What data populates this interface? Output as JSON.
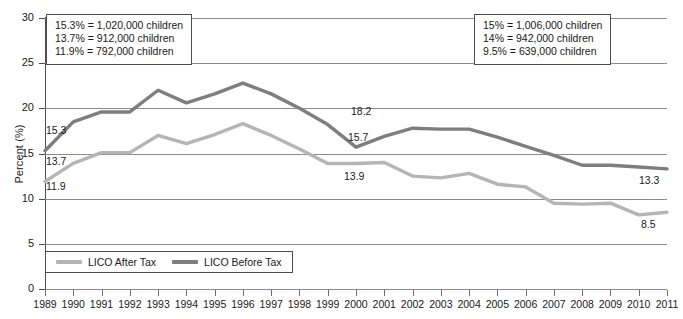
{
  "chart_data": {
    "type": "line",
    "title": "",
    "xlabel": "",
    "ylabel": "Percent (%)",
    "ylim": [
      0,
      30
    ],
    "ytick_step": 5,
    "grid": true,
    "legend_position": "bottom-left",
    "x": [
      1989,
      1990,
      1991,
      1992,
      1993,
      1994,
      1995,
      1996,
      1997,
      1998,
      1999,
      2000,
      2001,
      2002,
      2003,
      2004,
      2005,
      2006,
      2007,
      2008,
      2009,
      2010,
      2011
    ],
    "categories": [
      "1989",
      "1990",
      "1991",
      "1992",
      "1993",
      "1994",
      "1995",
      "1996",
      "1997",
      "1998",
      "1999",
      "2000",
      "2001",
      "2002",
      "2003",
      "2004",
      "2005",
      "2006",
      "2007",
      "2008",
      "2009",
      "2010",
      "2011"
    ],
    "series": [
      {
        "name": "LICO After Tax",
        "color": "#b5b5b5",
        "values": [
          11.9,
          13.9,
          15.1,
          15.1,
          17.0,
          16.1,
          17.1,
          18.3,
          17.0,
          15.5,
          13.9,
          13.9,
          14.0,
          12.5,
          12.3,
          12.8,
          11.6,
          11.3,
          9.5,
          9.4,
          9.5,
          8.2,
          8.5
        ]
      },
      {
        "name": "LICO Before Tax",
        "color": "#7e7e7e",
        "values": [
          15.3,
          18.5,
          19.6,
          19.6,
          22.0,
          20.6,
          21.6,
          22.8,
          21.6,
          20.0,
          18.2,
          15.7,
          16.9,
          17.8,
          17.7,
          17.7,
          16.8,
          15.8,
          14.8,
          13.7,
          13.7,
          13.5,
          13.3
        ]
      }
    ],
    "annotations": [
      {
        "name": "callout-1989-before",
        "label": "15.3",
        "x": 1989,
        "series": "LICO Before Tax"
      },
      {
        "name": "callout-1989-after-upper",
        "label": "13.7",
        "x": 1989,
        "series": "LICO After Tax"
      },
      {
        "name": "callout-1989-after",
        "label": "11.9",
        "x": 1989,
        "series": "LICO After Tax"
      },
      {
        "name": "callout-1999-before",
        "label": "18.2",
        "x": 1999,
        "series": "LICO Before Tax"
      },
      {
        "name": "callout-2000-before",
        "label": "15.7",
        "x": 2000,
        "series": "LICO Before Tax"
      },
      {
        "name": "callout-2000-after",
        "label": "13.9",
        "x": 2000,
        "series": "LICO After Tax"
      },
      {
        "name": "callout-2011-before",
        "label": "13.3",
        "x": 2011,
        "series": "LICO Before Tax"
      },
      {
        "name": "callout-2011-after",
        "label": "8.5",
        "x": 2011,
        "series": "LICO After Tax"
      }
    ]
  },
  "axis": {
    "y_title": "Percent (%)",
    "y_ticks": [
      "30",
      "25",
      "20",
      "15",
      "10",
      "5",
      "0"
    ]
  },
  "note_left": {
    "lines": [
      "15.3% = 1,020,000 children",
      "13.7% = 912,000 children",
      "11.9% = 792,000 children"
    ]
  },
  "note_right": {
    "lines": [
      "15% = 1,006,000 children",
      "14% = 942,000 children",
      "9.5% = 639,000 children"
    ]
  },
  "legend": {
    "entries": [
      {
        "label": "LICO After Tax",
        "color": "#b5b5b5"
      },
      {
        "label": "LICO Before Tax",
        "color": "#7e7e7e"
      }
    ]
  },
  "callouts": {
    "c1": "15.3",
    "c2": "13.7",
    "c3": "11.9",
    "c4": "18.2",
    "c5": "15.7",
    "c6": "13.9",
    "c7": "13.3",
    "c8": "8.5"
  }
}
